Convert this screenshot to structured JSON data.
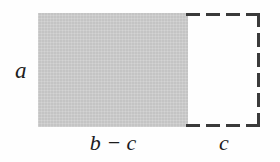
{
  "figure": {
    "type": "geometry-area-diagram",
    "width": 280,
    "height": 162,
    "background_color": "#fefefe"
  },
  "shapes": {
    "shaded_rectangle": {
      "name": "shaded-rectangle",
      "fill_color": "#c4c4c4",
      "border_style": "none",
      "width_label": "b − c",
      "height_label": "a"
    },
    "dashed_rectangle": {
      "name": "dashed-rectangle",
      "fill_color": "#ffffff",
      "border_style": "dashed",
      "border_color": "#3a3a3a",
      "width_label": "c",
      "height_label": "a"
    }
  },
  "labels": {
    "height": "a",
    "shaded_width": "b − c",
    "dashed_width": "c"
  }
}
